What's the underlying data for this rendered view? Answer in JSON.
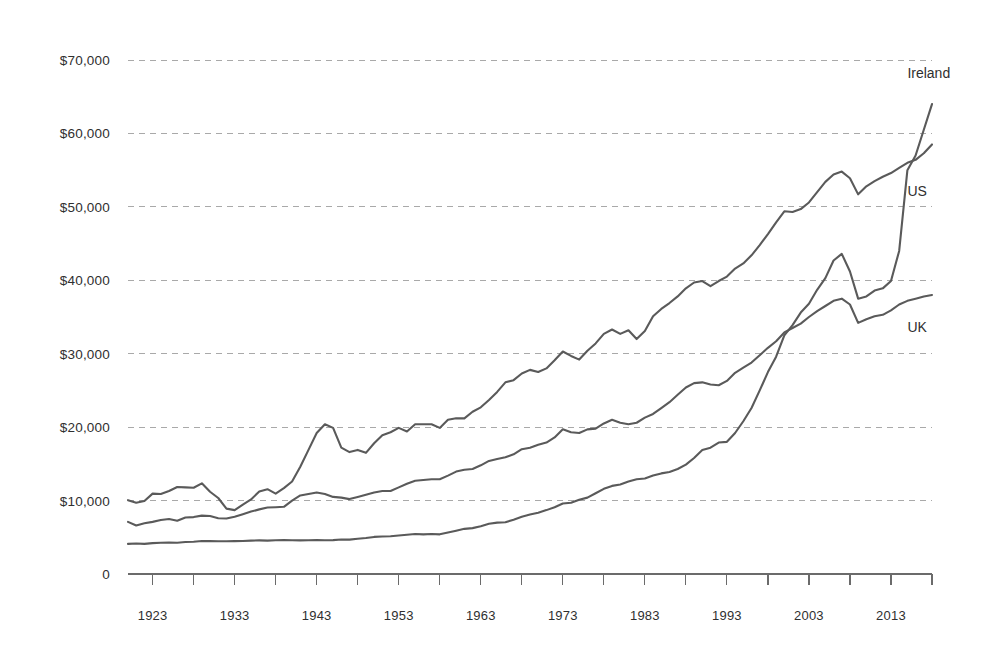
{
  "chart_data": {
    "type": "line",
    "title": "",
    "subtitle": "",
    "xlabel": "",
    "ylabel": "",
    "xlim": [
      1920,
      2018
    ],
    "ylim": [
      0,
      74000
    ],
    "grid": true,
    "legend_position": "right-inline",
    "y_ticks": [
      0,
      10000,
      20000,
      30000,
      40000,
      50000,
      60000,
      70000
    ],
    "y_tick_labels": [
      "0",
      "$10,000",
      "$20,000",
      "$30,000",
      "$40,000",
      "$50,000",
      "$60,000",
      "$70,000"
    ],
    "x_ticks": [
      1923,
      1933,
      1943,
      1953,
      1963,
      1973,
      1983,
      1993,
      2003,
      2013
    ],
    "x_tick_labels": [
      "1923",
      "1933",
      "1943",
      "1953",
      "1963",
      "1973",
      "1983",
      "1993",
      "2003",
      "2013"
    ],
    "x_minor_tick_interval": 5,
    "line_color": "#5a5a5a",
    "grid_color": "#a9a9a9",
    "axis_color": "#6b6b6b",
    "series": [
      {
        "name": "Ireland",
        "label": "Ireland",
        "color": "#5a5a5a",
        "label_position": {
          "x": 2015,
          "y": 67500
        },
        "x": [
          1920,
          1921,
          1922,
          1923,
          1924,
          1925,
          1926,
          1927,
          1928,
          1929,
          1930,
          1931,
          1932,
          1933,
          1934,
          1935,
          1936,
          1937,
          1938,
          1939,
          1940,
          1941,
          1942,
          1943,
          1944,
          1945,
          1946,
          1947,
          1948,
          1949,
          1950,
          1951,
          1952,
          1953,
          1954,
          1955,
          1956,
          1957,
          1958,
          1959,
          1960,
          1961,
          1962,
          1963,
          1964,
          1965,
          1966,
          1967,
          1968,
          1969,
          1970,
          1971,
          1972,
          1973,
          1974,
          1975,
          1976,
          1977,
          1978,
          1979,
          1980,
          1981,
          1982,
          1983,
          1984,
          1985,
          1986,
          1987,
          1988,
          1989,
          1990,
          1991,
          1992,
          1993,
          1994,
          1995,
          1996,
          1997,
          1998,
          1999,
          2000,
          2001,
          2002,
          2003,
          2004,
          2005,
          2006,
          2007,
          2008,
          2009,
          2010,
          2011,
          2012,
          2013,
          2014,
          2015,
          2016,
          2017,
          2018
        ],
        "y": [
          4100,
          4150,
          4100,
          4200,
          4250,
          4300,
          4250,
          4350,
          4400,
          4500,
          4480,
          4450,
          4450,
          4480,
          4500,
          4550,
          4580,
          4550,
          4600,
          4620,
          4600,
          4580,
          4600,
          4620,
          4600,
          4620,
          4700,
          4680,
          4800,
          4900,
          5050,
          5100,
          5150,
          5250,
          5350,
          5450,
          5400,
          5450,
          5400,
          5650,
          5900,
          6150,
          6250,
          6500,
          6850,
          7000,
          7050,
          7400,
          7800,
          8100,
          8350,
          8700,
          9100,
          9600,
          9700,
          10100,
          10400,
          11000,
          11600,
          12000,
          12200,
          12600,
          12900,
          13000,
          13400,
          13700,
          13900,
          14300,
          14900,
          15800,
          16900,
          17200,
          17900,
          18000,
          19200,
          20800,
          22600,
          25000,
          27500,
          29600,
          32500,
          33900,
          35600,
          36800,
          38700,
          40300,
          42700,
          43600,
          41200,
          37500,
          37800,
          38600,
          38900,
          39900,
          44000,
          55000,
          57000,
          60500,
          64000
        ]
      },
      {
        "name": "US",
        "label": "US",
        "color": "#5a5a5a",
        "label_position": {
          "x": 2015,
          "y": 51500
        },
        "x": [
          1920,
          1921,
          1922,
          1923,
          1924,
          1925,
          1926,
          1927,
          1928,
          1929,
          1930,
          1931,
          1932,
          1933,
          1934,
          1935,
          1936,
          1937,
          1938,
          1939,
          1940,
          1941,
          1942,
          1943,
          1944,
          1945,
          1946,
          1947,
          1948,
          1949,
          1950,
          1951,
          1952,
          1953,
          1954,
          1955,
          1956,
          1957,
          1958,
          1959,
          1960,
          1961,
          1962,
          1963,
          1964,
          1965,
          1966,
          1967,
          1968,
          1969,
          1970,
          1971,
          1972,
          1973,
          1974,
          1975,
          1976,
          1977,
          1978,
          1979,
          1980,
          1981,
          1982,
          1983,
          1984,
          1985,
          1986,
          1987,
          1988,
          1989,
          1990,
          1991,
          1992,
          1993,
          1994,
          1995,
          1996,
          1997,
          1998,
          1999,
          2000,
          2001,
          2002,
          2003,
          2004,
          2005,
          2006,
          2007,
          2008,
          2009,
          2010,
          2011,
          2012,
          2013,
          2014,
          2015,
          2016,
          2017,
          2018
        ],
        "y": [
          10050,
          9700,
          9950,
          10950,
          10900,
          11300,
          11850,
          11800,
          11750,
          12350,
          11200,
          10350,
          8900,
          8700,
          9450,
          10150,
          11250,
          11550,
          10950,
          11700,
          12600,
          14600,
          16900,
          19200,
          20400,
          19900,
          17200,
          16600,
          16900,
          16500,
          17800,
          18900,
          19300,
          19900,
          19400,
          20400,
          20400,
          20400,
          19900,
          21000,
          21200,
          21200,
          22100,
          22700,
          23700,
          24800,
          26100,
          26400,
          27300,
          27800,
          27500,
          28000,
          29100,
          30300,
          29700,
          29200,
          30400,
          31400,
          32700,
          33300,
          32700,
          33200,
          32000,
          33100,
          35100,
          36100,
          36900,
          37800,
          38900,
          39700,
          39900,
          39200,
          39900,
          40500,
          41600,
          42300,
          43400,
          44800,
          46300,
          47900,
          49400,
          49300,
          49700,
          50600,
          52000,
          53400,
          54400,
          54800,
          53900,
          51700,
          52800,
          53500,
          54100,
          54600,
          55300,
          56000,
          56400,
          57300,
          58500
        ]
      },
      {
        "name": "UK",
        "label": "UK",
        "color": "#5a5a5a",
        "label_position": {
          "x": 2015,
          "y": 33000
        },
        "x": [
          1920,
          1921,
          1922,
          1923,
          1924,
          1925,
          1926,
          1927,
          1928,
          1929,
          1930,
          1931,
          1932,
          1933,
          1934,
          1935,
          1936,
          1937,
          1938,
          1939,
          1940,
          1941,
          1942,
          1943,
          1944,
          1945,
          1946,
          1947,
          1948,
          1949,
          1950,
          1951,
          1952,
          1953,
          1954,
          1955,
          1956,
          1957,
          1958,
          1959,
          1960,
          1961,
          1962,
          1963,
          1964,
          1965,
          1966,
          1967,
          1968,
          1969,
          1970,
          1971,
          1972,
          1973,
          1974,
          1975,
          1976,
          1977,
          1978,
          1979,
          1980,
          1981,
          1982,
          1983,
          1984,
          1985,
          1986,
          1987,
          1988,
          1989,
          1990,
          1991,
          1992,
          1993,
          1994,
          1995,
          1996,
          1997,
          1998,
          1999,
          2000,
          2001,
          2002,
          2003,
          2004,
          2005,
          2006,
          2007,
          2008,
          2009,
          2010,
          2011,
          2012,
          2013,
          2014,
          2015,
          2016,
          2017,
          2018
        ],
        "y": [
          7100,
          6600,
          6900,
          7100,
          7350,
          7500,
          7250,
          7700,
          7750,
          7950,
          7900,
          7600,
          7550,
          7800,
          8150,
          8500,
          8800,
          9050,
          9100,
          9150,
          10000,
          10700,
          10900,
          11100,
          10900,
          10500,
          10400,
          10200,
          10500,
          10800,
          11100,
          11300,
          11300,
          11800,
          12300,
          12700,
          12800,
          12900,
          12900,
          13400,
          13950,
          14200,
          14300,
          14800,
          15400,
          15650,
          15900,
          16300,
          17000,
          17200,
          17600,
          17900,
          18600,
          19700,
          19300,
          19200,
          19700,
          19800,
          20500,
          21000,
          20600,
          20400,
          20600,
          21300,
          21800,
          22600,
          23400,
          24400,
          25400,
          26000,
          26100,
          25800,
          25700,
          26300,
          27400,
          28100,
          28800,
          29800,
          30800,
          31700,
          32900,
          33500,
          34100,
          35000,
          35800,
          36500,
          37200,
          37500,
          36700,
          34200,
          34700,
          35100,
          35300,
          35900,
          36700,
          37200,
          37500,
          37800,
          38000
        ]
      }
    ]
  }
}
